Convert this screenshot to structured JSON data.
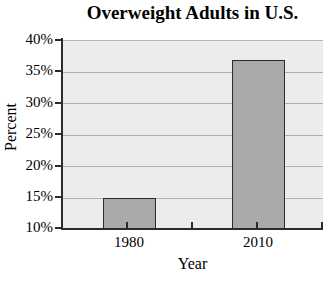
{
  "chart_data": {
    "type": "bar",
    "title": "Overweight Adults in U.S.",
    "xlabel": "Year",
    "ylabel": "Percent",
    "categories": [
      "1980",
      "2010"
    ],
    "values": [
      15,
      37
    ],
    "value_labels": [
      "15%",
      "37%"
    ],
    "ylim": [
      10,
      40
    ],
    "ytick_values": [
      40,
      35,
      30,
      25,
      20,
      15,
      10
    ],
    "ytick_labels": [
      "40%",
      "35%",
      "30%",
      "25%",
      "20%",
      "15%",
      "10%"
    ],
    "grid": true,
    "grid_axis": "y",
    "legend": null,
    "bar_fill_color": "#a9a9a9",
    "bar_edge_color": "#2b2b2b",
    "plot_background_color": "#ececec",
    "gridline_color": "#b0b0b0",
    "axis_color": "#2b2b2b",
    "text_color": "#000000"
  }
}
